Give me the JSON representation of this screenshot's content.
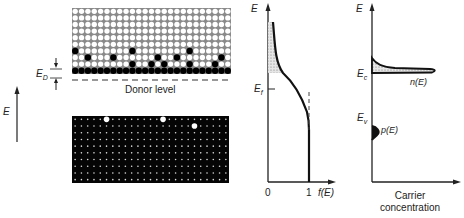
{
  "figure": {
    "left_axis": {
      "label": "E"
    },
    "donor_gap_label": {
      "main": "E",
      "sub": "D"
    },
    "donor_level_label": "Donor level",
    "conduction_band": {
      "cols": 25,
      "rows": 10,
      "filled": [
        [
          6,
          0
        ],
        [
          6,
          9
        ],
        [
          6,
          18
        ],
        [
          7,
          2
        ],
        [
          7,
          6
        ],
        [
          7,
          13
        ],
        [
          7,
          16
        ],
        [
          7,
          23
        ],
        [
          8,
          9
        ],
        [
          8,
          12
        ],
        [
          8,
          14
        ],
        [
          8,
          18
        ],
        [
          8,
          22
        ],
        [
          9,
          0
        ],
        [
          9,
          2
        ],
        [
          9,
          4
        ],
        [
          9,
          6
        ],
        [
          9,
          8
        ],
        [
          9,
          12
        ],
        [
          9,
          13
        ],
        [
          9,
          15
        ],
        [
          9,
          18
        ],
        [
          9,
          20
        ],
        [
          9,
          21
        ],
        [
          9,
          23
        ],
        [
          9,
          24
        ]
      ],
      "filled_bottom_row": [
        1,
        2,
        3,
        5,
        7,
        9,
        10,
        11,
        12,
        13,
        14,
        16,
        17,
        18,
        19,
        21,
        22,
        23,
        24
      ]
    },
    "valence_band": {
      "cols": 25,
      "rows": 10,
      "holes": [
        [
          0,
          5
        ],
        [
          0,
          14
        ],
        [
          1,
          19
        ]
      ]
    },
    "fermi_plot": {
      "y_axis_label": "E",
      "x_axis_label": "f(E)",
      "ef_label": "E",
      "ef_sub": "f",
      "x_ticks": [
        "0",
        "1"
      ]
    },
    "carrier_plot": {
      "y_axis_label": "E",
      "ec_label": "E",
      "ec_sub": "c",
      "ev_label": "E",
      "ev_sub": "v",
      "n_label": "n(E)",
      "p_label": "p(E)",
      "x_axis_label_line1": "Carrier",
      "x_axis_label_line2": "concentration"
    }
  }
}
